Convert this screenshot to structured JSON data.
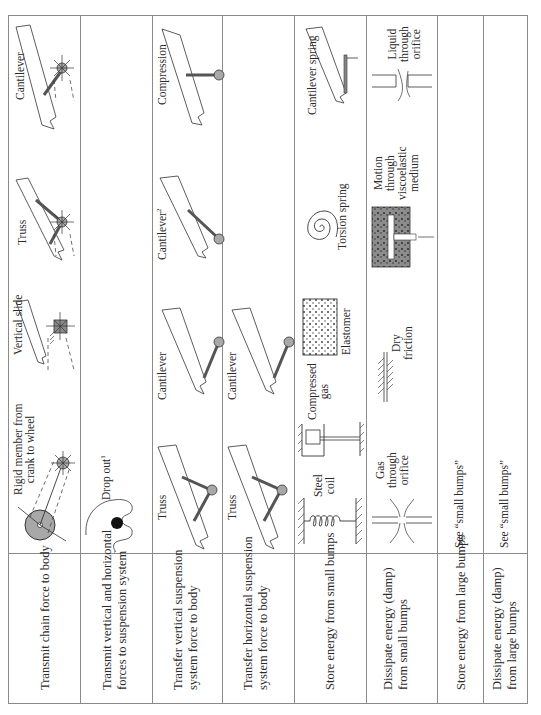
{
  "table": {
    "rows": [
      {
        "function": "Transmit chain force to body",
        "concepts": [
          {
            "label": "Rigid member from crank to wheel",
            "icon": "crank-wheel-sketch"
          },
          {
            "label": "Vertical slide",
            "icon": "vertical-slide-sketch"
          },
          {
            "label": "Truss",
            "icon": "truss-sketch"
          },
          {
            "label": "Cantilever",
            "icon": "cantilever-sketch"
          }
        ]
      },
      {
        "function": "Transmit vertical and horizontal forces to suspension system",
        "concepts": [
          {
            "label": "Drop out",
            "footnote": "1",
            "icon": "drop-out-sketch"
          }
        ]
      },
      {
        "function": "Transfer vertical suspension system force to body",
        "concepts": [
          {
            "label": "Truss",
            "icon": "truss-sketch"
          },
          {
            "label": "Cantilever",
            "icon": "cantilever-sketch"
          },
          {
            "label": "Cantilever",
            "footnote": "2",
            "icon": "cantilever-sketch"
          },
          {
            "label": "Compression",
            "icon": "compression-sketch"
          }
        ]
      },
      {
        "function": "Transfer horizontal suspension system force to body",
        "concepts": [
          {
            "label": "Truss",
            "icon": "truss-sketch"
          },
          {
            "label": "Cantilever",
            "icon": "cantilever-sketch"
          }
        ]
      },
      {
        "function": "Store energy from small bumps",
        "concepts": [
          {
            "label": "Steel coil",
            "icon": "steel-coil-sketch"
          },
          {
            "label": "Compressed gas",
            "icon": "compressed-gas-sketch"
          },
          {
            "label": "Elastomer",
            "icon": "elastomer-sketch"
          },
          {
            "label": "Torsion spring",
            "icon": "torsion-spring-sketch"
          },
          {
            "label": "Cantilever spring",
            "icon": "cantilever-spring-sketch"
          }
        ]
      },
      {
        "function": "Dissipate energy (damp) from small bumps",
        "concepts": [
          {
            "label": "Gas through orifice",
            "icon": "gas-orifice-sketch"
          },
          {
            "label": "Dry friction",
            "icon": "dry-friction-sketch"
          },
          {
            "label": "Motion through viscoelastic medium",
            "icon": "viscoelastic-sketch"
          },
          {
            "label": "Liquid through orifice",
            "icon": "liquid-orifice-sketch"
          }
        ]
      },
      {
        "function": "Store energy from large bumps",
        "concepts": [
          {
            "label": "See “small bumps”"
          }
        ]
      },
      {
        "function": "Dissipate energy (damp) from large bumps",
        "concepts": [
          {
            "label": "See “small bumps”"
          }
        ]
      }
    ]
  },
  "fn": {
    "r1": "Transmit chain force to body",
    "r2a": "Transmit vertical and horizontal",
    "r2b": "forces to suspension system",
    "r3a": "Transfer vertical suspension",
    "r3b": "system force to body",
    "r4a": "Transfer horizontal suspension",
    "r4b": "system force to body",
    "r5": "Store energy from small bumps",
    "r6a": "Dissipate energy (damp)",
    "r6b": "from small bumps",
    "r7": "Store energy from large bumps",
    "r8a": "Dissipate energy (damp)",
    "r8b": "from large bumps"
  },
  "lbl": {
    "rigid_a": "Rigid member from",
    "rigid_b": "crank to wheel",
    "vslide": "Vertical slide",
    "truss": "Truss",
    "cantilever": "Cantilever",
    "dropout": "Drop out",
    "dropout_fn": "1",
    "cant2_fn": "2",
    "compression": "Compression",
    "steel_a": "Steel",
    "steel_b": "coil",
    "cgas_a": "Compressed",
    "cgas_b": "gas",
    "elastomer": "Elastomer",
    "torsion": "Torsion spring",
    "cspring": "Cantilever spring",
    "gas_a": "Gas",
    "gas_b": "through",
    "gas_c": "orifice",
    "dry_a": "Dry",
    "dry_b": "friction",
    "visc_a": "Motion",
    "visc_b": "through",
    "visc_c": "viscoelastic",
    "visc_d": "medium",
    "liq_a": "Liquid",
    "liq_b": "through",
    "liq_c": "orifice",
    "see_small": "See “small bumps”"
  },
  "colors": {
    "line": "#8a8a8a",
    "sketch": "#333333",
    "fill_gray": "#a0a0a0",
    "dark_member": "#555555"
  }
}
